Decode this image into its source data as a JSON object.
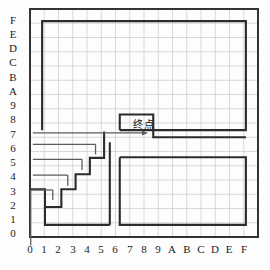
{
  "figure": {
    "type": "maze-grid-diagram",
    "goal_label": "终点",
    "background_color": "#fdfdfd",
    "grid_color": "#c9c9c9",
    "wall_color": "#2b2b2b",
    "path_color": "#5a5a5a",
    "axis_color": "#1b1b1b"
  },
  "axes": {
    "x_label_text": "",
    "y_label_text": "",
    "x_ticks": [
      "0",
      "1",
      "2",
      "3",
      "4",
      "5",
      "6",
      "7",
      "8",
      "9",
      "A",
      "B",
      "C",
      "D",
      "E",
      "F"
    ],
    "y_ticks_top_to_bottom": [
      "F",
      "E",
      "D",
      "C",
      "B",
      "A",
      "9",
      "8",
      "7",
      "6",
      "5",
      "4",
      "3",
      "2",
      "1",
      "0"
    ],
    "x_range": [
      0,
      16
    ],
    "y_range": [
      0,
      16
    ],
    "cell_size_px": 14.25,
    "origin_px": {
      "x": 30,
      "y": 237
    }
  },
  "chart_data": {
    "type": "table",
    "title": "",
    "xlabel": "",
    "ylabel": "",
    "grid": true,
    "columns": [
      "0",
      "1",
      "2",
      "3",
      "4",
      "5",
      "6",
      "7",
      "8",
      "9",
      "A",
      "B",
      "C",
      "D",
      "E",
      "F"
    ],
    "rows": [
      "F",
      "E",
      "D",
      "C",
      "B",
      "A",
      "9",
      "8",
      "7",
      "6",
      "5",
      "4",
      "3",
      "2",
      "1",
      "0"
    ],
    "outer_border": {
      "x0": 0,
      "y0": 0,
      "x1": 16,
      "y1": 16
    },
    "walls": [
      {
        "name": "upper-room",
        "points": [
          [
            0.85,
            7.5
          ],
          [
            0.85,
            15.15
          ],
          [
            15.15,
            15.15
          ],
          [
            15.15,
            7.5
          ],
          [
            6.3,
            7.5
          ]
        ]
      },
      {
        "name": "goal-alcove",
        "points": [
          [
            6.3,
            7.5
          ],
          [
            6.3,
            8.6
          ],
          [
            8.65,
            8.6
          ],
          [
            8.65,
            7.0
          ],
          [
            15.15,
            7.0
          ]
        ]
      },
      {
        "name": "lower-right-room",
        "points": [
          [
            6.3,
            5.6
          ],
          [
            15.15,
            5.6
          ],
          [
            15.15,
            0.85
          ],
          [
            6.3,
            0.85
          ],
          [
            6.3,
            5.6
          ]
        ]
      },
      {
        "name": "staircase",
        "points": [
          [
            0.0,
            3.35
          ],
          [
            1.05,
            3.35
          ],
          [
            1.05,
            2.1
          ],
          [
            2.2,
            2.1
          ],
          [
            2.2,
            3.35
          ],
          [
            3.2,
            3.35
          ],
          [
            3.2,
            4.4
          ],
          [
            4.2,
            4.4
          ],
          [
            4.2,
            5.55
          ],
          [
            5.2,
            5.55
          ],
          [
            5.2,
            7.4
          ]
        ]
      },
      {
        "name": "lower-left-wall",
        "points": [
          [
            1.05,
            2.1
          ],
          [
            1.05,
            0.85
          ],
          [
            5.6,
            0.85
          ]
        ]
      },
      {
        "name": "center-vertical",
        "points": [
          [
            5.6,
            6.65
          ],
          [
            5.6,
            0.85
          ]
        ]
      }
    ],
    "path_segments": [
      {
        "name": "entry",
        "points": [
          [
            0.05,
            -0.6
          ],
          [
            0.05,
            3.3
          ]
        ]
      },
      {
        "name": "row-3",
        "points": [
          [
            0.05,
            3.3
          ],
          [
            1.6,
            3.3
          ]
        ]
      },
      {
        "name": "row-4",
        "points": [
          [
            0.2,
            4.35
          ],
          [
            2.65,
            4.35
          ]
        ]
      },
      {
        "name": "row-5",
        "points": [
          [
            0.2,
            5.45
          ],
          [
            3.65,
            5.45
          ]
        ]
      },
      {
        "name": "row-6",
        "points": [
          [
            0.2,
            6.5
          ],
          [
            4.6,
            6.5
          ]
        ]
      },
      {
        "name": "row-7",
        "points": [
          [
            0.2,
            7.3
          ],
          [
            8.0,
            7.3
          ]
        ]
      },
      {
        "name": "riser-1",
        "points": [
          [
            1.6,
            3.3
          ],
          [
            1.6,
            2.6
          ]
        ]
      },
      {
        "name": "riser-2",
        "points": [
          [
            2.65,
            4.35
          ],
          [
            2.65,
            3.6
          ]
        ]
      },
      {
        "name": "riser-3",
        "points": [
          [
            3.65,
            5.45
          ],
          [
            3.65,
            4.7
          ]
        ]
      },
      {
        "name": "riser-4",
        "points": [
          [
            4.6,
            6.5
          ],
          [
            4.6,
            5.8
          ]
        ]
      }
    ],
    "arrow_head": {
      "x": 8.0,
      "y": 7.3,
      "direction": "right"
    },
    "goal_marker": {
      "label": "终点",
      "x": 7.4,
      "y": 7.9
    }
  }
}
